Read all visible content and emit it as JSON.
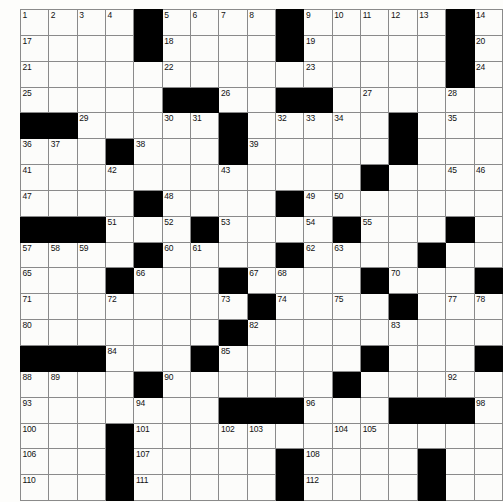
{
  "puzzle": {
    "title": "Crossword Grid",
    "type": "crossword-grid",
    "columns": 17,
    "rows": 19,
    "colors": {
      "block": "#000000",
      "cell": "#fcfcfa",
      "grid_line": "#8a8a8a",
      "number_text": "#111111",
      "page_background": "#fdfdfb"
    },
    "legend": {
      "0": "open cell",
      "1": "blocked cell"
    },
    "blocks": [
      [
        0,
        0,
        0,
        0,
        1,
        0,
        0,
        0,
        0,
        1,
        0,
        0,
        0,
        0,
        0,
        1,
        0,
        0,
        0
      ],
      [
        0,
        0,
        0,
        0,
        1,
        0,
        0,
        0,
        0,
        1,
        0,
        0,
        0,
        0,
        0,
        1,
        0,
        0,
        0
      ],
      [
        0,
        0,
        0,
        0,
        0,
        0,
        0,
        0,
        0,
        0,
        0,
        0,
        0,
        0,
        0,
        1,
        0,
        0,
        0
      ],
      [
        0,
        0,
        0,
        0,
        0,
        1,
        1,
        0,
        0,
        1,
        1,
        0,
        0,
        0,
        0,
        0,
        0,
        0,
        0
      ],
      [
        1,
        1,
        0,
        0,
        0,
        0,
        0,
        1,
        0,
        0,
        0,
        0,
        0,
        1,
        0,
        0,
        0,
        0,
        0
      ],
      [
        0,
        0,
        0,
        1,
        0,
        0,
        0,
        1,
        0,
        0,
        0,
        0,
        0,
        1,
        0,
        0,
        0,
        1,
        1
      ],
      [
        0,
        0,
        0,
        0,
        0,
        0,
        0,
        0,
        0,
        0,
        0,
        0,
        1,
        0,
        0,
        0,
        0,
        0,
        0
      ],
      [
        0,
        0,
        0,
        0,
        1,
        0,
        0,
        0,
        0,
        1,
        0,
        0,
        0,
        0,
        0,
        0,
        0,
        0,
        0
      ],
      [
        1,
        1,
        1,
        0,
        0,
        0,
        1,
        0,
        0,
        0,
        0,
        1,
        0,
        0,
        0,
        1,
        0,
        0,
        0
      ],
      [
        0,
        0,
        0,
        0,
        1,
        0,
        0,
        0,
        0,
        1,
        0,
        0,
        0,
        0,
        1,
        0,
        0,
        0,
        0
      ],
      [
        0,
        0,
        0,
        1,
        0,
        0,
        0,
        1,
        0,
        0,
        0,
        0,
        1,
        0,
        0,
        0,
        1,
        1,
        1
      ],
      [
        0,
        0,
        0,
        0,
        0,
        0,
        0,
        0,
        1,
        0,
        0,
        0,
        0,
        1,
        0,
        0,
        0,
        0,
        0
      ],
      [
        0,
        0,
        0,
        0,
        0,
        0,
        0,
        1,
        0,
        0,
        0,
        0,
        0,
        0,
        0,
        0,
        0,
        0,
        0
      ],
      [
        1,
        1,
        1,
        0,
        0,
        0,
        1,
        0,
        0,
        0,
        0,
        0,
        1,
        0,
        0,
        0,
        1,
        0,
        0
      ],
      [
        0,
        0,
        0,
        0,
        1,
        0,
        0,
        0,
        0,
        0,
        0,
        1,
        0,
        0,
        0,
        0,
        0,
        1,
        1
      ],
      [
        0,
        0,
        0,
        0,
        0,
        0,
        0,
        1,
        1,
        1,
        0,
        0,
        0,
        1,
        1,
        1,
        0,
        0,
        1
      ],
      [
        0,
        0,
        0,
        1,
        0,
        0,
        0,
        0,
        0,
        0,
        0,
        0,
        0,
        0,
        0,
        0,
        0,
        0,
        0
      ],
      [
        0,
        0,
        0,
        1,
        0,
        0,
        0,
        0,
        0,
        1,
        0,
        0,
        0,
        0,
        1,
        0,
        0,
        0,
        0
      ],
      [
        0,
        0,
        0,
        1,
        0,
        0,
        0,
        0,
        0,
        1,
        0,
        0,
        0,
        0,
        1,
        0,
        0,
        0,
        0
      ]
    ],
    "numbers": [
      {
        "row": 1,
        "col": 1,
        "label": "1"
      },
      {
        "row": 1,
        "col": 2,
        "label": "2"
      },
      {
        "row": 1,
        "col": 3,
        "label": "3"
      },
      {
        "row": 1,
        "col": 4,
        "label": "4"
      },
      {
        "row": 1,
        "col": 6,
        "label": "5"
      },
      {
        "row": 1,
        "col": 7,
        "label": "6"
      },
      {
        "row": 1,
        "col": 8,
        "label": "7"
      },
      {
        "row": 1,
        "col": 9,
        "label": "8"
      },
      {
        "row": 1,
        "col": 11,
        "label": "9"
      },
      {
        "row": 1,
        "col": 12,
        "label": "10"
      },
      {
        "row": 1,
        "col": 13,
        "label": "11"
      },
      {
        "row": 1,
        "col": 14,
        "label": "12"
      },
      {
        "row": 1,
        "col": 15,
        "label": "13"
      },
      {
        "row": 1,
        "col": 17,
        "label": "14"
      },
      {
        "row": 1,
        "col": 18,
        "label": "15"
      },
      {
        "row": 1,
        "col": 19,
        "label": "16"
      },
      {
        "row": 2,
        "col": 1,
        "label": "17"
      },
      {
        "row": 2,
        "col": 6,
        "label": "18"
      },
      {
        "row": 2,
        "col": 11,
        "label": "19"
      },
      {
        "row": 2,
        "col": 17,
        "label": "20"
      },
      {
        "row": 3,
        "col": 1,
        "label": "21"
      },
      {
        "row": 3,
        "col": 6,
        "label": "22"
      },
      {
        "row": 3,
        "col": 11,
        "label": "23"
      },
      {
        "row": 3,
        "col": 17,
        "label": "24"
      },
      {
        "row": 4,
        "col": 1,
        "label": "25"
      },
      {
        "row": 4,
        "col": 8,
        "label": "26"
      },
      {
        "row": 4,
        "col": 13,
        "label": "27"
      },
      {
        "row": 4,
        "col": 16,
        "label": "28"
      },
      {
        "row": 5,
        "col": 3,
        "label": "29"
      },
      {
        "row": 5,
        "col": 6,
        "label": "30"
      },
      {
        "row": 5,
        "col": 7,
        "label": "31"
      },
      {
        "row": 5,
        "col": 10,
        "label": "32"
      },
      {
        "row": 5,
        "col": 11,
        "label": "33"
      },
      {
        "row": 5,
        "col": 12,
        "label": "34"
      },
      {
        "row": 5,
        "col": 16,
        "label": "35"
      },
      {
        "row": 6,
        "col": 1,
        "label": "36"
      },
      {
        "row": 6,
        "col": 2,
        "label": "37"
      },
      {
        "row": 6,
        "col": 5,
        "label": "38"
      },
      {
        "row": 6,
        "col": 9,
        "label": "39"
      },
      {
        "row": 6,
        "col": 14,
        "label": "40"
      },
      {
        "row": 7,
        "col": 1,
        "label": "41"
      },
      {
        "row": 7,
        "col": 4,
        "label": "42"
      },
      {
        "row": 7,
        "col": 8,
        "label": "43"
      },
      {
        "row": 7,
        "col": 13,
        "label": "44"
      },
      {
        "row": 7,
        "col": 16,
        "label": "45"
      },
      {
        "row": 7,
        "col": 17,
        "label": "46"
      },
      {
        "row": 8,
        "col": 1,
        "label": "47"
      },
      {
        "row": 8,
        "col": 6,
        "label": "48"
      },
      {
        "row": 8,
        "col": 11,
        "label": "49"
      },
      {
        "row": 8,
        "col": 12,
        "label": "50"
      },
      {
        "row": 9,
        "col": 4,
        "label": "51"
      },
      {
        "row": 9,
        "col": 6,
        "label": "52"
      },
      {
        "row": 9,
        "col": 8,
        "label": "53"
      },
      {
        "row": 9,
        "col": 11,
        "label": "54"
      },
      {
        "row": 9,
        "col": 13,
        "label": "55"
      },
      {
        "row": 9,
        "col": 16,
        "label": "56"
      },
      {
        "row": 10,
        "col": 1,
        "label": "57"
      },
      {
        "row": 10,
        "col": 2,
        "label": "58"
      },
      {
        "row": 10,
        "col": 3,
        "label": "59"
      },
      {
        "row": 10,
        "col": 6,
        "label": "60"
      },
      {
        "row": 10,
        "col": 7,
        "label": "61"
      },
      {
        "row": 10,
        "col": 11,
        "label": "62"
      },
      {
        "row": 10,
        "col": 12,
        "label": "63"
      },
      {
        "row": 10,
        "col": 15,
        "label": "64"
      },
      {
        "row": 11,
        "col": 1,
        "label": "65"
      },
      {
        "row": 11,
        "col": 5,
        "label": "66"
      },
      {
        "row": 11,
        "col": 9,
        "label": "67"
      },
      {
        "row": 11,
        "col": 10,
        "label": "68"
      },
      {
        "row": 11,
        "col": 13,
        "label": "69"
      },
      {
        "row": 11,
        "col": 14,
        "label": "70"
      },
      {
        "row": 12,
        "col": 1,
        "label": "71"
      },
      {
        "row": 12,
        "col": 4,
        "label": "72"
      },
      {
        "row": 12,
        "col": 8,
        "label": "73"
      },
      {
        "row": 12,
        "col": 10,
        "label": "74"
      },
      {
        "row": 12,
        "col": 12,
        "label": "75"
      },
      {
        "row": 12,
        "col": 14,
        "label": "76"
      },
      {
        "row": 12,
        "col": 16,
        "label": "77"
      },
      {
        "row": 12,
        "col": 17,
        "label": "78"
      },
      {
        "row": 12,
        "col": 18,
        "label": "79"
      },
      {
        "row": 13,
        "col": 1,
        "label": "80"
      },
      {
        "row": 13,
        "col": 8,
        "label": "81"
      },
      {
        "row": 13,
        "col": 9,
        "label": "82"
      },
      {
        "row": 13,
        "col": 14,
        "label": "83"
      },
      {
        "row": 14,
        "col": 4,
        "label": "84"
      },
      {
        "row": 14,
        "col": 8,
        "label": "85"
      },
      {
        "row": 14,
        "col": 13,
        "label": "86"
      },
      {
        "row": 14,
        "col": 17,
        "label": "87"
      },
      {
        "row": 15,
        "col": 1,
        "label": "88"
      },
      {
        "row": 15,
        "col": 2,
        "label": "89"
      },
      {
        "row": 15,
        "col": 6,
        "label": "90"
      },
      {
        "row": 15,
        "col": 12,
        "label": "91"
      },
      {
        "row": 15,
        "col": 16,
        "label": "92"
      },
      {
        "row": 16,
        "col": 1,
        "label": "93"
      },
      {
        "row": 16,
        "col": 5,
        "label": "94"
      },
      {
        "row": 16,
        "col": 10,
        "label": "95"
      },
      {
        "row": 16,
        "col": 11,
        "label": "96"
      },
      {
        "row": 16,
        "col": 14,
        "label": "97"
      },
      {
        "row": 16,
        "col": 17,
        "label": "98"
      },
      {
        "row": 16,
        "col": 18,
        "label": "99"
      },
      {
        "row": 17,
        "col": 1,
        "label": "100"
      },
      {
        "row": 17,
        "col": 5,
        "label": "101"
      },
      {
        "row": 17,
        "col": 8,
        "label": "102"
      },
      {
        "row": 17,
        "col": 9,
        "label": "103"
      },
      {
        "row": 17,
        "col": 12,
        "label": "104"
      },
      {
        "row": 17,
        "col": 13,
        "label": "105"
      },
      {
        "row": 18,
        "col": 1,
        "label": "106"
      },
      {
        "row": 18,
        "col": 5,
        "label": "107"
      },
      {
        "row": 18,
        "col": 11,
        "label": "108"
      },
      {
        "row": 18,
        "col": 15,
        "label": "109"
      },
      {
        "row": 19,
        "col": 1,
        "label": "110"
      },
      {
        "row": 19,
        "col": 5,
        "label": "111"
      },
      {
        "row": 19,
        "col": 11,
        "label": "112"
      },
      {
        "row": 19,
        "col": 15,
        "label": "113"
      }
    ]
  }
}
